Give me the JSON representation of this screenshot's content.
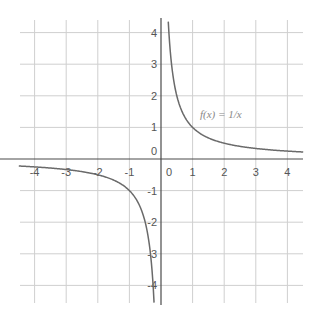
{
  "chart_data": {
    "type": "line",
    "title": "",
    "function": "1/x",
    "annotation": "f(x) = 1/x",
    "xlabel": "",
    "ylabel": "",
    "xlim": [
      -4.5,
      4.5
    ],
    "ylim": [
      -4.5,
      4.3
    ],
    "grid": true,
    "legend": "none",
    "x_ticks": [
      -4,
      -3,
      -2,
      -1,
      0,
      1,
      2,
      3,
      4
    ],
    "x_tick_labels": [
      "-4",
      "-3",
      "-2",
      "-1",
      "0",
      "1",
      "2",
      "3",
      "4"
    ],
    "y_ticks": [
      -4,
      -3,
      -2,
      -1,
      0,
      1,
      2,
      3,
      4
    ],
    "y_tick_labels": [
      "-4",
      "-3",
      "-2",
      "-1",
      "0",
      "1",
      "2",
      "3",
      "4"
    ],
    "series": [
      {
        "name": "f(x) = 1/x (x>0)",
        "x": [
          0.23,
          0.25,
          0.3,
          0.4,
          0.5,
          0.75,
          1,
          1.5,
          2,
          2.5,
          3,
          3.5,
          4,
          4.5
        ],
        "y": [
          4.35,
          4,
          3.33,
          2.5,
          2,
          1.33,
          1,
          0.67,
          0.5,
          0.4,
          0.33,
          0.29,
          0.25,
          0.22
        ]
      },
      {
        "name": "f(x) = 1/x (x<0)",
        "x": [
          -4.5,
          -4,
          -3.5,
          -3,
          -2.5,
          -2,
          -1.5,
          -1,
          -0.75,
          -0.5,
          -0.4,
          -0.3,
          -0.25,
          -0.22
        ],
        "y": [
          -0.22,
          -0.25,
          -0.29,
          -0.33,
          -0.4,
          -0.5,
          -0.67,
          -1,
          -1.33,
          -2,
          -2.5,
          -3.33,
          -4,
          -4.5
        ]
      }
    ]
  }
}
